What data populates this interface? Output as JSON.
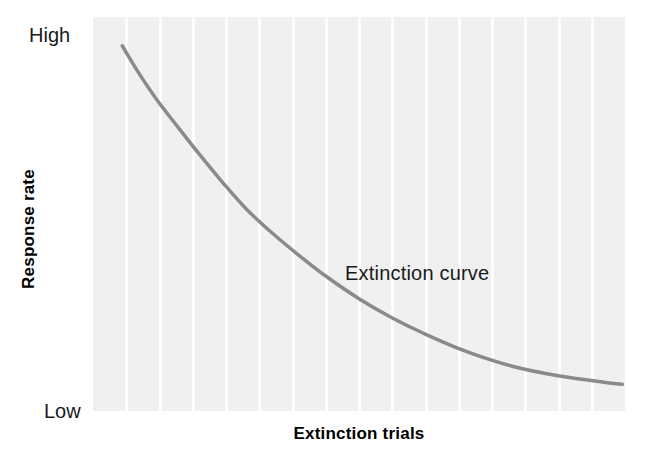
{
  "chart_data": {
    "type": "line",
    "title": "",
    "subtitle": "",
    "xlabel": "Extinction trials",
    "ylabel": "Response rate",
    "ytick_labels": [
      "High",
      "Low"
    ],
    "xtick_labels": [],
    "annotations": [
      {
        "text": "Extinction curve",
        "x": 0.3,
        "y": 0.58
      }
    ],
    "legend": {
      "entries": [],
      "position": "none"
    },
    "grid": {
      "vertical": true,
      "horizontal": false,
      "vertical_count": 15,
      "color": "#fdfdfd"
    },
    "xlim": [
      0,
      1
    ],
    "ylim": [
      0,
      1
    ],
    "series": [
      {
        "name": "Extinction curve",
        "color": "#8a8a8a",
        "line_width": 3.5,
        "x": [
          0.055,
          0.085,
          0.12,
          0.16,
          0.201,
          0.245,
          0.29,
          0.34,
          0.39,
          0.44,
          0.5,
          0.56,
          0.62,
          0.7,
          0.79,
          0.88,
          0.96,
          0.995
        ],
        "y": [
          0.927,
          0.86,
          0.79,
          0.72,
          0.65,
          0.578,
          0.51,
          0.448,
          0.392,
          0.34,
          0.285,
          0.238,
          0.198,
          0.152,
          0.113,
          0.088,
          0.073,
          0.068
        ]
      }
    ],
    "colors": {
      "curve": "#8a8a8a",
      "panel_background": "#f0f0f0",
      "gridline": "#fdfdfd",
      "figure_background": "#ffffff",
      "text": "#1a1a1a",
      "axis_title": "#000000"
    }
  },
  "axes": {
    "y": {
      "title": "Response rate",
      "high_label": "High",
      "low_label": "Low"
    },
    "x": {
      "title": "Extinction trials"
    }
  },
  "annotation": {
    "curve_label": "Extinction curve"
  }
}
